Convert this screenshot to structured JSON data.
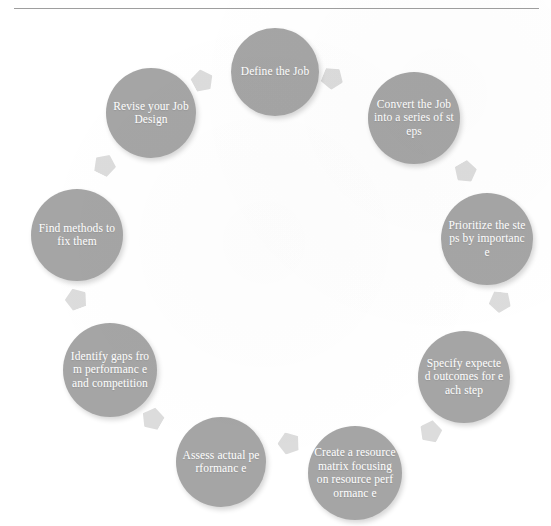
{
  "diagram": {
    "type": "cycle",
    "direction": "clockwise",
    "node_count": 9,
    "node_color": "#a5a5a5",
    "node_text_color": "#ffffff",
    "arrow_color": "#dcdcdc",
    "background_color": "#ffffff",
    "rule_color": "#9e9e9e",
    "nodes": [
      {
        "id": "define-the-job",
        "label": "Define the Job",
        "order": 1,
        "cx": 275,
        "cy": 72,
        "d": 88
      },
      {
        "id": "convert-the-job-into-a-series-of-steps",
        "label": "Convert the Job into a series of steps",
        "order": 2,
        "cx": 414,
        "cy": 118,
        "d": 92
      },
      {
        "id": "prioritize-the-steps-by-importance",
        "label": "Prioritize the steps by importance",
        "order": 3,
        "cx": 487,
        "cy": 239,
        "d": 92
      },
      {
        "id": "specify-expected-outcomes-for-each-step",
        "label": "Specify expected outcomes for each step",
        "order": 4,
        "cx": 464,
        "cy": 377,
        "d": 92
      },
      {
        "id": "create-a-resource-matrix-focusing-on-resource-performance",
        "label": "Create a resource matrix focusing on resource performanc e",
        "order": 5,
        "cx": 355,
        "cy": 473,
        "d": 94
      },
      {
        "id": "assess-actual-performance",
        "label": "Assess actual performanc e",
        "order": 6,
        "cx": 221,
        "cy": 462,
        "d": 90
      },
      {
        "id": "identify-gaps-from-performance-and-competition",
        "label": "Identify gaps from performanc e and competition",
        "order": 7,
        "cx": 110,
        "cy": 370,
        "d": 94
      },
      {
        "id": "find-methods-to-fix-them",
        "label": "Find methods to fix them",
        "order": 8,
        "cx": 77,
        "cy": 235,
        "d": 92
      },
      {
        "id": "revise-your-job-design",
        "label": "Revise your Job Design",
        "order": 9,
        "cx": 151,
        "cy": 113,
        "d": 90
      }
    ],
    "arrows": [
      {
        "id": "arrow-revise-to-define",
        "from": "revise-your-job-design",
        "to": "define-the-job",
        "x": 203,
        "y": 80,
        "rot": 62
      },
      {
        "id": "arrow-define-to-convert",
        "from": "define-the-job",
        "to": "convert-the-job-into-a-series-of-steps",
        "x": 333,
        "y": 78,
        "rot": 112
      },
      {
        "id": "arrow-convert-to-prioritize",
        "from": "convert-the-job-into-a-series-of-steps",
        "to": "prioritize-the-steps-by-importance",
        "x": 466,
        "y": 172,
        "rot": 150
      },
      {
        "id": "arrow-prioritize-to-specify",
        "from": "prioritize-the-steps-by-importance",
        "to": "specify-expected-outcomes-for-each-step",
        "x": 500,
        "y": 302,
        "rot": 186
      },
      {
        "id": "arrow-specify-to-create",
        "from": "specify-expected-outcomes-for-each-step",
        "to": "create-a-resource-matrix-focusing-on-resource-performance",
        "x": 430,
        "y": 432,
        "rot": 226
      },
      {
        "id": "arrow-create-to-assess",
        "from": "create-a-resource-matrix-focusing-on-resource-performance",
        "to": "assess-actual-performance",
        "x": 288,
        "y": 443,
        "rot": 268
      },
      {
        "id": "arrow-assess-to-identify",
        "from": "assess-actual-performance",
        "to": "identify-gaps-from-performance-and-competition",
        "x": 152,
        "y": 418,
        "rot": 300
      },
      {
        "id": "arrow-identify-to-find",
        "from": "identify-gaps-from-performance-and-competition",
        "to": "find-methods-to-fix-them",
        "x": 76,
        "y": 298,
        "rot": 340
      },
      {
        "id": "arrow-find-to-revise",
        "from": "find-methods-to-fix-them",
        "to": "revise-your-job-design",
        "x": 105,
        "y": 164,
        "rot": 26
      }
    ]
  }
}
